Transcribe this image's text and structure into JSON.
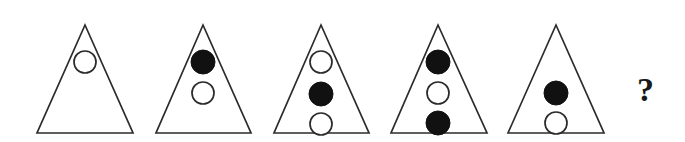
{
  "puzzle": {
    "type": "visual-analogy-sequence",
    "title": "Triangle circle sequence puzzle",
    "background_color": "#ffffff",
    "stroke_color": "#2b2b2b",
    "fill_color": "#111111",
    "hollow_fill": "#ffffff",
    "question_text": "?",
    "question_x": 645,
    "question_y": 95,
    "triangle_count": 5,
    "triangles": [
      {
        "index": 1,
        "name": "triangle-1",
        "apex_x": 85,
        "apex_y": 25,
        "base_left_x": 37,
        "base_right_x": 133,
        "base_y": 133,
        "circle_count": 1,
        "circles": [
          {
            "name": "circle-1-1",
            "cx": 85,
            "cy": 62,
            "r": 11,
            "state": "hollow"
          }
        ]
      },
      {
        "index": 2,
        "name": "triangle-2",
        "apex_x": 203,
        "apex_y": 25,
        "base_left_x": 156,
        "base_right_x": 251,
        "base_y": 133,
        "circle_count": 2,
        "circles": [
          {
            "name": "circle-2-1",
            "cx": 203,
            "cy": 62,
            "r": 12,
            "state": "filled"
          },
          {
            "name": "circle-2-2",
            "cx": 203,
            "cy": 93,
            "r": 11,
            "state": "hollow"
          }
        ]
      },
      {
        "index": 3,
        "name": "triangle-3",
        "apex_x": 321,
        "apex_y": 25,
        "base_left_x": 274,
        "base_right_x": 369,
        "base_y": 133,
        "circle_count": 3,
        "circles": [
          {
            "name": "circle-3-1",
            "cx": 321,
            "cy": 62,
            "r": 11,
            "state": "hollow"
          },
          {
            "name": "circle-3-2",
            "cx": 321,
            "cy": 94,
            "r": 12,
            "state": "filled"
          },
          {
            "name": "circle-3-3",
            "cx": 321,
            "cy": 124,
            "r": 11,
            "state": "hollow"
          }
        ]
      },
      {
        "index": 4,
        "name": "triangle-4",
        "apex_x": 438,
        "apex_y": 25,
        "base_left_x": 391,
        "base_right_x": 487,
        "base_y": 133,
        "circle_count": 3,
        "circles": [
          {
            "name": "circle-4-1",
            "cx": 438,
            "cy": 62,
            "r": 12,
            "state": "filled"
          },
          {
            "name": "circle-4-2",
            "cx": 438,
            "cy": 93,
            "r": 11,
            "state": "hollow"
          },
          {
            "name": "circle-4-3",
            "cx": 438,
            "cy": 123,
            "r": 12,
            "state": "filled"
          }
        ]
      },
      {
        "index": 5,
        "name": "triangle-5",
        "apex_x": 556,
        "apex_y": 25,
        "base_left_x": 508,
        "base_right_x": 604,
        "base_y": 133,
        "circle_count": 2,
        "circles": [
          {
            "name": "circle-5-1",
            "cx": 556,
            "cy": 93,
            "r": 12,
            "state": "filled"
          },
          {
            "name": "circle-5-2",
            "cx": 556,
            "cy": 123,
            "r": 11,
            "state": "hollow"
          }
        ]
      }
    ]
  }
}
